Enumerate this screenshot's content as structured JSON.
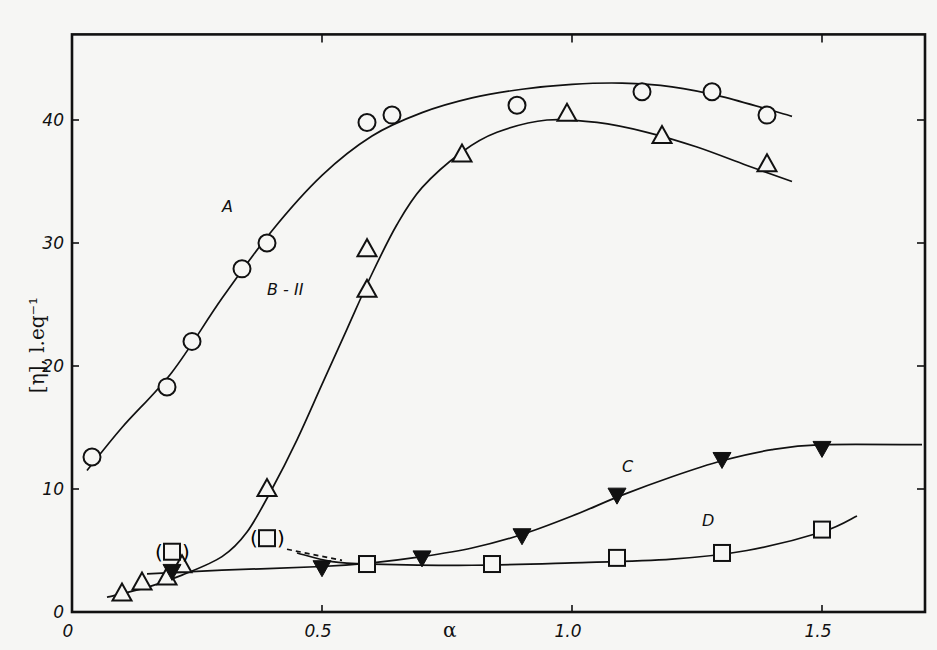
{
  "chart_data": {
    "type": "scatter",
    "title": "",
    "xlabel": "α",
    "ylabel": "[η], l.eq⁻¹",
    "xlim": [
      0,
      1.7
    ],
    "ylim": [
      0,
      47
    ],
    "grid": false,
    "legend": "inline curve labels",
    "x_ticks": [
      0,
      0.5,
      1.0,
      1.5
    ],
    "x_tick_labels": [
      "0",
      "0.5",
      "1.0",
      "1.5"
    ],
    "y_ticks": [
      0,
      10,
      20,
      30,
      40
    ],
    "y_tick_labels": [
      "0",
      "10",
      "20",
      "30",
      "40"
    ],
    "series": [
      {
        "name": "A",
        "marker": "open-circle",
        "points": [
          [
            0.04,
            12.6
          ],
          [
            0.19,
            18.3
          ],
          [
            0.24,
            22.0
          ],
          [
            0.34,
            27.9
          ],
          [
            0.39,
            30.0
          ],
          [
            0.59,
            39.8
          ],
          [
            0.64,
            40.4
          ],
          [
            0.89,
            41.2
          ],
          [
            1.14,
            42.3
          ],
          [
            1.28,
            42.3
          ],
          [
            1.39,
            40.4
          ]
        ],
        "curve": [
          [
            0.03,
            11.5
          ],
          [
            0.1,
            15
          ],
          [
            0.2,
            19.5
          ],
          [
            0.3,
            25.5
          ],
          [
            0.4,
            31
          ],
          [
            0.5,
            35.5
          ],
          [
            0.6,
            38.7
          ],
          [
            0.7,
            40.6
          ],
          [
            0.8,
            41.8
          ],
          [
            0.9,
            42.5
          ],
          [
            1.0,
            42.9
          ],
          [
            1.1,
            43.0
          ],
          [
            1.2,
            42.7
          ],
          [
            1.3,
            41.9
          ],
          [
            1.44,
            40.3
          ]
        ]
      },
      {
        "name": "B-II",
        "marker": "open-triangle",
        "points": [
          [
            0.1,
            1.5
          ],
          [
            0.14,
            2.4
          ],
          [
            0.19,
            2.8
          ],
          [
            0.22,
            3.8
          ],
          [
            0.39,
            10.0
          ],
          [
            0.59,
            29.5
          ],
          [
            0.59,
            26.2
          ],
          [
            0.78,
            37.2
          ],
          [
            0.99,
            40.5
          ],
          [
            1.18,
            38.7
          ],
          [
            1.39,
            36.4
          ]
        ],
        "curve": [
          [
            0.07,
            1.2
          ],
          [
            0.15,
            2.0
          ],
          [
            0.22,
            3.0
          ],
          [
            0.3,
            4.5
          ],
          [
            0.35,
            6.5
          ],
          [
            0.4,
            10
          ],
          [
            0.45,
            14
          ],
          [
            0.5,
            18.5
          ],
          [
            0.55,
            23
          ],
          [
            0.6,
            27.5
          ],
          [
            0.65,
            31.5
          ],
          [
            0.7,
            34.5
          ],
          [
            0.78,
            37.4
          ],
          [
            0.85,
            39
          ],
          [
            0.95,
            40
          ],
          [
            1.05,
            39.8
          ],
          [
            1.15,
            39
          ],
          [
            1.25,
            37.8
          ],
          [
            1.35,
            36.3
          ],
          [
            1.44,
            35
          ]
        ]
      },
      {
        "name": "C",
        "marker": "filled-down-triangle",
        "points": [
          [
            0.2,
            3.3
          ],
          [
            0.5,
            3.6
          ],
          [
            0.7,
            4.4
          ],
          [
            0.9,
            6.2
          ],
          [
            1.09,
            9.5
          ],
          [
            1.3,
            12.4
          ],
          [
            1.5,
            13.3
          ]
        ],
        "curve": [
          [
            0.15,
            3.1
          ],
          [
            0.3,
            3.4
          ],
          [
            0.5,
            3.7
          ],
          [
            0.6,
            4.0
          ],
          [
            0.7,
            4.5
          ],
          [
            0.8,
            5.2
          ],
          [
            0.9,
            6.3
          ],
          [
            1.0,
            7.8
          ],
          [
            1.1,
            9.5
          ],
          [
            1.2,
            11.0
          ],
          [
            1.3,
            12.3
          ],
          [
            1.4,
            13.2
          ],
          [
            1.5,
            13.6
          ],
          [
            1.7,
            13.6
          ]
        ]
      },
      {
        "name": "D",
        "marker": "open-square",
        "points": [
          [
            0.59,
            3.9
          ],
          [
            0.84,
            3.9
          ],
          [
            1.09,
            4.4
          ],
          [
            1.3,
            4.8
          ],
          [
            1.5,
            6.7
          ]
        ],
        "parenthesized_points": [
          [
            0.2,
            4.9
          ],
          [
            0.39,
            6.0
          ]
        ],
        "curve": [
          [
            0.45,
            4.8
          ],
          [
            0.52,
            4.1
          ],
          [
            0.6,
            3.9
          ],
          [
            0.8,
            3.8
          ],
          [
            1.0,
            4.0
          ],
          [
            1.2,
            4.3
          ],
          [
            1.35,
            5.0
          ],
          [
            1.5,
            6.5
          ],
          [
            1.57,
            7.8
          ]
        ],
        "dashed_segment": [
          [
            0.43,
            5.1
          ],
          [
            0.54,
            4.2
          ]
        ]
      }
    ],
    "annotations": [
      {
        "text": "A",
        "x": 0.3,
        "y": 32.5
      },
      {
        "text": "B - II",
        "x": 0.39,
        "y": 25.8
      },
      {
        "text": "C",
        "x": 1.1,
        "y": 11.4
      },
      {
        "text": "D",
        "x": 1.26,
        "y": 7.0
      },
      {
        "text": "(□)",
        "x": 0.2,
        "y": 4.9
      },
      {
        "text": "(□)",
        "x": 0.39,
        "y": 6.0
      }
    ]
  }
}
